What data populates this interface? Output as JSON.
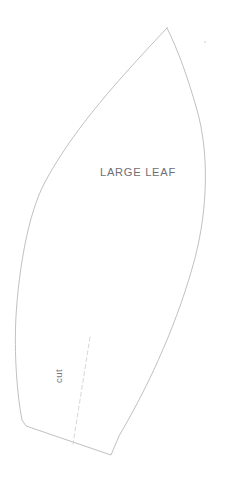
{
  "document": {
    "type": "craft-pattern-template",
    "title": "Large Leaf Pattern Piece",
    "background_color": "#ffffff",
    "width_px": 230,
    "height_px": 483
  },
  "pattern": {
    "piece_label": "LARGE LEAF",
    "piece_label_color": "#6e6e74",
    "outline_color": "#b9b9bd",
    "outline_fill": "#ffffff",
    "outline_name": "large-leaf-outline",
    "tip_point": "167,28",
    "base_left_point": "26,426",
    "base_right_point": "111,455"
  },
  "cut_marking": {
    "label": "cut",
    "label_color": "#74747a",
    "label_rotation_deg": -90,
    "line_style": "dashed",
    "line_color": "#cfcfd4",
    "line_start": "90,337",
    "line_end": "73,444"
  },
  "artifacts": {
    "speck_label": "scan-speck",
    "speck_color": "#dedee2",
    "speck_point": "205,42"
  },
  "outline_geometry": {
    "path": "M 167 28 C 120 78 74 128 45 182 C 28 214 19 268 16 316 C 14 354 17 394 22 420 L 26 426 L 111 455 L 119 436 C 152 380 179 318 195 258 C 208 208 209 152 197 110 C 188 78 178 50 167 28 Z"
  }
}
